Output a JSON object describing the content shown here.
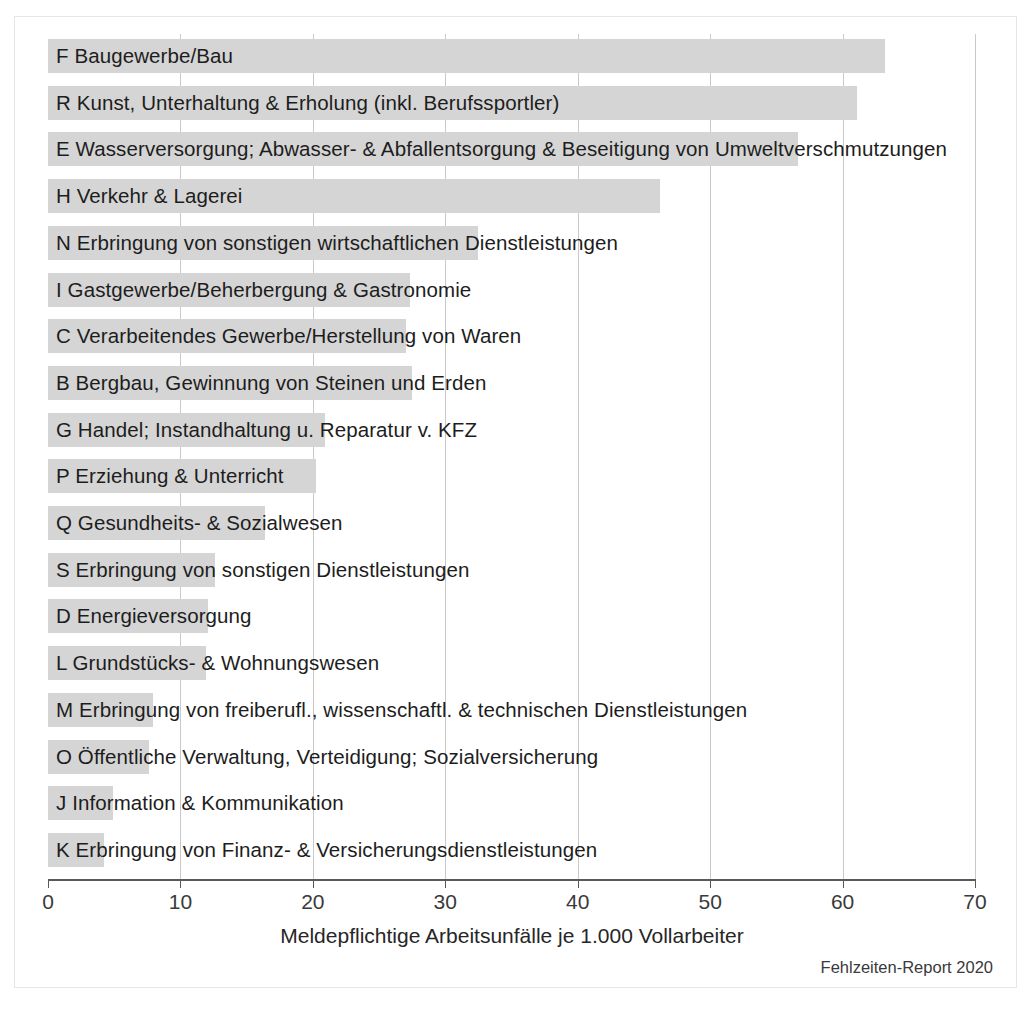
{
  "chart_data": {
    "type": "bar",
    "orientation": "horizontal",
    "title": "",
    "xlabel": "Meldepflichtige Arbeitsunfälle je 1.000 Vollarbeiter",
    "ylabel": "",
    "xlim": [
      0,
      70
    ],
    "xticks": [
      0,
      10,
      20,
      30,
      40,
      50,
      60,
      70
    ],
    "xtick_labels": [
      "0",
      "10",
      "20",
      "30",
      "40",
      "50",
      "60",
      "70"
    ],
    "grid": "vertical",
    "legend": "none",
    "bar_color": "#d5d5d5",
    "categories": [
      "F Baugewerbe/Bau",
      "R Kunst, Unterhaltung & Erholung (inkl. Berufssportler)",
      "E Wasserversorgung; Abwasser- & Abfallentsorgung & Beseitigung von Umweltverschmutzungen",
      "H Verkehr & Lagerei",
      "N Erbringung von sonstigen wirtschaftlichen Dienstleistungen",
      "I Gastgewerbe/Beherbergung & Gastronomie",
      "C Verarbeitendes Gewerbe/Herstellung von Waren",
      "B Bergbau, Gewinnung von Steinen und Erden",
      "G Handel; Instandhaltung u. Reparatur v. KFZ",
      "P Erziehung & Unterricht",
      "Q Gesundheits- & Sozialwesen",
      "S Erbringung von sonstigen Dienstleistungen",
      "D Energieversorgung",
      "L Grundstücks- & Wohnungswesen",
      "M Erbringung von freiberufl., wissenschaftl. & technischen Dienstleistungen",
      "O Öffentliche Verwaltung, Verteidigung; Sozialversicherung",
      "J Information & Kommunikation",
      "K Erbringung von Finanz- & Versicherungsdienstleistungen"
    ],
    "values": [
      63.2,
      61.1,
      56.6,
      46.2,
      32.5,
      27.3,
      27.0,
      27.5,
      20.9,
      20.2,
      16.4,
      12.6,
      12.1,
      11.9,
      7.9,
      7.6,
      4.9,
      4.2
    ]
  },
  "source_note": "Fehlzeiten-Report 2020"
}
